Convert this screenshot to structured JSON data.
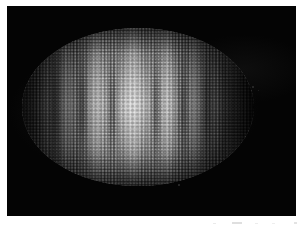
{
  "figure": {
    "kind": "fluorescence-micrograph",
    "specimen": "Drosophila embryo",
    "orientation": "anterior-left, posterior-right, lateral view",
    "channel": "grayscale",
    "panel": {
      "background_color": "#050505",
      "page_margin_color": "#ffffff",
      "left": 7,
      "top": 6,
      "width": 289,
      "height": 210
    },
    "embryo": {
      "left": 22,
      "top": 28,
      "width": 232,
      "height": 158,
      "body_color": "#cdcdcd",
      "dim_pole_color": "#141414"
    },
    "stripes": [
      {
        "name": "stripe-1",
        "x": 40,
        "width": 12,
        "intensity": 0.3
      },
      {
        "name": "stripe-2",
        "x": 58,
        "width": 16,
        "intensity": 0.55
      },
      {
        "name": "stripe-3",
        "x": 86,
        "width": 18,
        "intensity": 0.7
      },
      {
        "name": "stripe-4",
        "x": 120,
        "width": 26,
        "intensity": 0.95
      },
      {
        "name": "stripe-5",
        "x": 158,
        "width": 18,
        "intensity": 0.72
      },
      {
        "name": "stripe-6",
        "x": 186,
        "width": 16,
        "intensity": 0.52
      },
      {
        "name": "stripe-7",
        "x": 210,
        "width": 12,
        "intensity": 0.3
      }
    ],
    "grooves": [
      {
        "name": "groove-1",
        "x": 50,
        "width": 10
      },
      {
        "name": "groove-2",
        "x": 76,
        "width": 12
      },
      {
        "name": "groove-3",
        "x": 106,
        "width": 13
      },
      {
        "name": "groove-4",
        "x": 150,
        "width": 12
      },
      {
        "name": "groove-5",
        "x": 178,
        "width": 11
      },
      {
        "name": "groove-6",
        "x": 202,
        "width": 10
      }
    ],
    "specks": [
      {
        "name": "speck-posterior",
        "x": 252,
        "top": 80,
        "size": 2.0,
        "opacity": 0.5
      },
      {
        "name": "speck-posterior-2",
        "x": 258,
        "top": 84,
        "size": 1.4,
        "opacity": 0.35
      },
      {
        "name": "speck-ventral",
        "x": 178,
        "top": 178,
        "size": 1.8,
        "opacity": 0.55
      }
    ],
    "page_artifacts": [
      {
        "name": "artifact-mark-1",
        "x": 213,
        "top": 7,
        "width": 3,
        "height": 1.2,
        "opacity": 0.55
      },
      {
        "name": "artifact-mark-2",
        "x": 232,
        "top": 6,
        "width": 10,
        "height": 2.0,
        "opacity": 0.85
      },
      {
        "name": "artifact-mark-3",
        "x": 255,
        "top": 7,
        "width": 3,
        "height": 1.2,
        "opacity": 0.5
      },
      {
        "name": "artifact-mark-4",
        "x": 272,
        "top": 7,
        "width": 3,
        "height": 1.2,
        "opacity": 0.45
      },
      {
        "name": "artifact-mark-5",
        "x": 294,
        "top": 6,
        "width": 3,
        "height": 2.0,
        "opacity": 0.75
      }
    ],
    "caption_fragment": ""
  }
}
